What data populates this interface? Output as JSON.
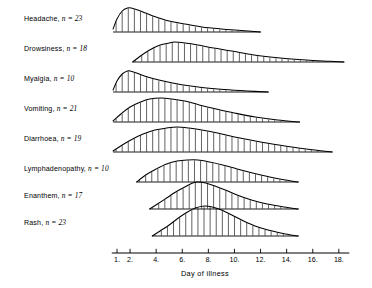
{
  "chart_data": {
    "type": "area",
    "title": "",
    "xlabel": "Day of illness",
    "ylabel": "",
    "xlim": [
      0.6,
      18.6
    ],
    "xticks": [
      1,
      2,
      4,
      6,
      8,
      10,
      12,
      14,
      16,
      18
    ],
    "xtick_labels": [
      "1.",
      "2.",
      "4.",
      "6.",
      "8.",
      "10.",
      "12.",
      "14.",
      "16.",
      "18."
    ],
    "grid": false,
    "legend": "none",
    "fill_style": "vertical-hatch",
    "series": [
      {
        "name": "Headache",
        "n": 23,
        "label": "Headache,",
        "n_text": "n = 23",
        "start_day": 0.7,
        "end_day": 12.0,
        "peak_day": 2.1,
        "peak_height": 24,
        "x": [
          0.7,
          1.0,
          1.4,
          1.8,
          2.1,
          2.6,
          3.2,
          4.0,
          5.0,
          6.2,
          7.5,
          9.0,
          10.5,
          12.0
        ],
        "values": [
          3,
          13,
          21,
          24,
          24,
          22,
          19,
          15,
          11,
          8,
          5,
          3,
          1.5,
          0
        ]
      },
      {
        "name": "Drowsiness",
        "n": 18,
        "label": "Drowsiness,",
        "n_text": "n = 18",
        "start_day": 2.2,
        "end_day": 18.4,
        "peak_day": 5.4,
        "peak_height": 20,
        "x": [
          2.2,
          2.8,
          3.5,
          4.3,
          5.0,
          5.4,
          6.2,
          7.2,
          8.4,
          9.8,
          11.5,
          13.5,
          15.5,
          17.2,
          18.4
        ],
        "values": [
          0,
          6,
          12,
          17,
          19,
          20,
          19,
          17,
          14,
          11,
          7,
          4,
          2,
          0.8,
          0
        ]
      },
      {
        "name": "Myalgia",
        "n": 10,
        "label": "Myalgia,",
        "n_text": "n = 10",
        "start_day": 0.7,
        "end_day": 12.6,
        "peak_day": 2.0,
        "peak_height": 21,
        "x": [
          0.7,
          1.0,
          1.4,
          1.8,
          2.0,
          2.5,
          3.1,
          3.9,
          4.9,
          6.1,
          7.5,
          9.2,
          11.0,
          12.6
        ],
        "values": [
          2,
          11,
          18,
          21,
          21,
          19,
          16,
          13,
          10,
          7,
          4.5,
          2.5,
          1,
          0
        ]
      },
      {
        "name": "Vomiting",
        "n": 21,
        "label": "Vomiting,",
        "n_text": "n = 21",
        "start_day": 0.7,
        "end_day": 15.0,
        "peak_day": 4.4,
        "peak_height": 24,
        "x": [
          0.7,
          1.3,
          2.0,
          2.8,
          3.5,
          4.4,
          5.2,
          6.2,
          7.3,
          8.6,
          10.0,
          11.6,
          13.3,
          15.0
        ],
        "values": [
          1,
          8,
          15,
          20,
          23,
          24,
          23,
          21,
          17,
          13,
          9,
          5,
          2,
          0
        ]
      },
      {
        "name": "Diarrhoea",
        "n": 19,
        "label": "Diarrhoea,",
        "n_text": "n = 19",
        "start_day": 0.7,
        "end_day": 17.5,
        "peak_day": 5.6,
        "peak_height": 25,
        "x": [
          0.7,
          1.4,
          2.2,
          3.0,
          3.9,
          4.8,
          5.6,
          6.5,
          7.5,
          8.7,
          10.0,
          11.6,
          13.4,
          15.5,
          17.5
        ],
        "values": [
          1,
          7,
          13,
          18,
          22,
          24,
          25,
          24,
          22,
          19,
          15,
          11,
          7,
          3,
          0
        ]
      },
      {
        "name": "Lymphadenopathy",
        "n": 10,
        "label": "Lymphadenopathy,",
        "n_text": "n = 10",
        "start_day": 2.5,
        "end_day": 14.9,
        "peak_day": 6.4,
        "peak_height": 22,
        "x": [
          2.5,
          3.2,
          4.0,
          4.8,
          5.6,
          6.4,
          7.2,
          8.1,
          9.1,
          10.2,
          11.4,
          12.7,
          13.9,
          14.9
        ],
        "values": [
          0,
          7,
          13,
          18,
          21,
          22,
          22,
          20,
          17,
          13,
          9,
          5,
          2,
          0
        ]
      },
      {
        "name": "Enanthem",
        "n": 17,
        "label": "Enanthem,",
        "n_text": "n = 17",
        "start_day": 3.5,
        "end_day": 14.9,
        "peak_day": 7.2,
        "peak_height": 27,
        "x": [
          3.5,
          4.1,
          4.8,
          5.5,
          6.2,
          6.8,
          7.2,
          7.8,
          8.5,
          9.3,
          10.2,
          11.3,
          12.5,
          13.8,
          14.9
        ],
        "values": [
          0,
          5,
          11,
          17,
          22,
          26,
          27,
          26,
          23,
          19,
          14,
          9,
          5,
          2,
          0
        ]
      },
      {
        "name": "Rash",
        "n": 23,
        "label": "Rash,",
        "n_text": "n = 23",
        "start_day": 3.7,
        "end_day": 14.9,
        "peak_day": 7.7,
        "peak_height": 30,
        "x": [
          3.7,
          4.3,
          5.0,
          5.7,
          6.4,
          7.0,
          7.7,
          8.3,
          9.0,
          9.8,
          10.7,
          11.8,
          12.9,
          13.9,
          14.9
        ],
        "values": [
          0,
          5,
          11,
          18,
          24,
          28,
          30,
          29,
          26,
          21,
          15,
          9,
          5,
          2,
          0
        ]
      }
    ]
  },
  "axis": {
    "title": "Day of illness"
  },
  "colors": {
    "ink": "#000000",
    "background": "#ffffff"
  }
}
